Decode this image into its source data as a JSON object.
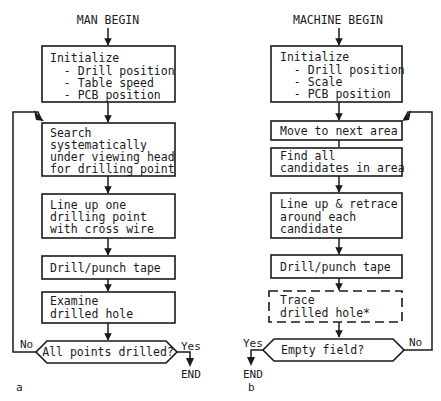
{
  "diagram": {
    "man": {
      "start": "MAN BEGIN",
      "steps": [
        {
          "lines": [
            "Initialize",
            "  - Drill position",
            "  - Table speed",
            "  - PCB position"
          ]
        },
        {
          "lines": [
            "Search",
            "systematically",
            "under viewing head",
            "for drilling point"
          ]
        },
        {
          "lines": [
            "Line up one",
            "drilling point",
            "with cross wire"
          ]
        },
        {
          "lines": [
            "Drill/punch tape"
          ]
        },
        {
          "lines": [
            "Examine",
            "drilled hole"
          ]
        }
      ],
      "decision": "All points drilled?",
      "no_label": "No",
      "yes_label": "Yes",
      "end": "END",
      "panel_label": "a"
    },
    "machine": {
      "start": "MACHINE BEGIN",
      "steps": [
        {
          "lines": [
            "Initialize",
            "  - Drill position",
            "  - Scale",
            "  - PCB position"
          ]
        },
        {
          "lines": [
            "Move to next area"
          ]
        },
        {
          "lines": [
            "Find all",
            "candidates in area"
          ]
        },
        {
          "lines": [
            "Line up & retrace",
            "around each",
            "candidate"
          ]
        },
        {
          "lines": [
            "Drill/punch tape"
          ]
        },
        {
          "lines": [
            "Trace",
            "drilled hole*"
          ],
          "dashed": true
        }
      ],
      "decision": "Empty field?",
      "no_label": "No",
      "yes_label": "Yes",
      "end": "END",
      "panel_label": "b"
    }
  }
}
